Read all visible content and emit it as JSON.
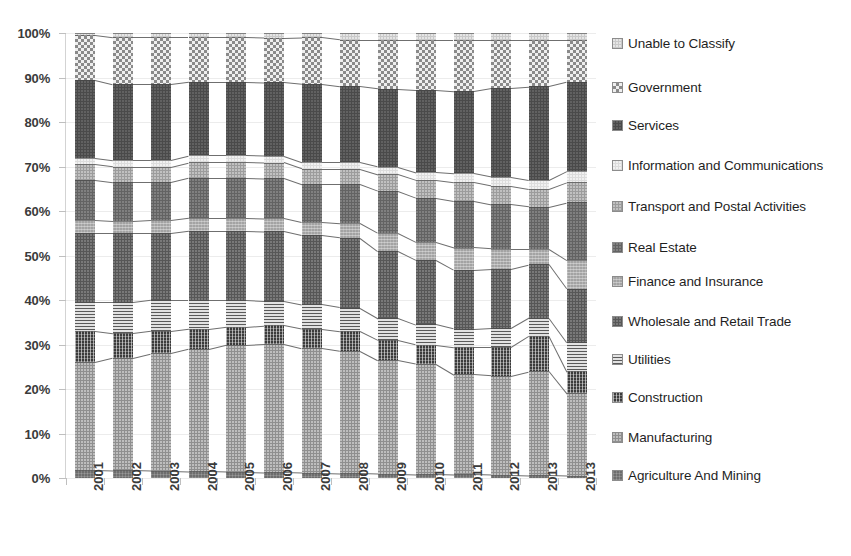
{
  "chart_data": {
    "type": "bar",
    "stacked": true,
    "normalized": "100%",
    "title": "",
    "subtitle": "",
    "xlabel": "",
    "ylabel": "",
    "ylim": [
      0,
      100
    ],
    "grid": true,
    "legend_position": "right",
    "y_tick_labels": [
      "0%",
      "10%",
      "20%",
      "30%",
      "40%",
      "50%",
      "60%",
      "70%",
      "80%",
      "90%",
      "100%"
    ],
    "y_tick_values": [
      0,
      10,
      20,
      30,
      40,
      50,
      60,
      70,
      80,
      90,
      100
    ],
    "categories": [
      "2001",
      "2002",
      "2003",
      "2004",
      "2005",
      "2006",
      "2007",
      "2008",
      "2009",
      "2010",
      "2011",
      "2012",
      "2013",
      "2013"
    ],
    "series": [
      {
        "name": "Agriculture And Mining",
        "pattern": "p-agri",
        "color": "#6d6d6d",
        "values": [
          1.8,
          1.7,
          1.6,
          1.5,
          1.4,
          1.3,
          1.2,
          1.1,
          1.0,
          0.9,
          0.8,
          0.7,
          0.6,
          0.5
        ]
      },
      {
        "name": "Manufacturing",
        "pattern": "p-manu",
        "color": "#8f8f8f",
        "values": [
          24.2,
          25.3,
          26.4,
          27.5,
          28.6,
          28.9,
          28.0,
          27.5,
          25.5,
          24.8,
          22.5,
          22.3,
          23.4,
          18.5
        ]
      },
      {
        "name": "Construction",
        "pattern": "p-cons",
        "color": "#3b3b3b",
        "values": [
          7.0,
          5.5,
          5.0,
          4.5,
          4.0,
          4.1,
          4.3,
          4.4,
          4.5,
          4.3,
          6.2,
          6.5,
          8.0,
          5.0
        ]
      },
      {
        "name": "Utilities",
        "pattern": "p-util",
        "color": "#e2e2e2",
        "values": [
          6.5,
          7.0,
          7.0,
          6.5,
          6.0,
          5.5,
          5.5,
          5.3,
          5.0,
          4.5,
          4.0,
          4.2,
          4.0,
          6.5
        ]
      },
      {
        "name": "Wholesale and Retail Trade",
        "pattern": "p-whol",
        "color": "#575757",
        "values": [
          15.5,
          15.5,
          15.0,
          15.5,
          15.5,
          15.6,
          15.5,
          15.7,
          15.0,
          14.5,
          13.3,
          13.3,
          12.0,
          12.0
        ]
      },
      {
        "name": "Finance and Insurance",
        "pattern": "p-fina",
        "color": "#a3a3a3",
        "values": [
          3.0,
          2.8,
          3.0,
          3.0,
          3.0,
          3.0,
          3.0,
          3.2,
          4.0,
          4.0,
          5.0,
          4.5,
          3.5,
          6.5
        ]
      },
      {
        "name": "Real Estate",
        "pattern": "p-real",
        "color": "#636363",
        "values": [
          9.0,
          8.7,
          8.5,
          9.0,
          9.0,
          9.0,
          8.5,
          8.8,
          9.5,
          10.0,
          10.5,
          10.0,
          9.5,
          13.0
        ]
      },
      {
        "name": "Transport and Postal Activities",
        "pattern": "p-tran",
        "color": "#9c9c9c",
        "values": [
          3.5,
          3.5,
          3.5,
          3.5,
          3.5,
          3.5,
          3.5,
          3.5,
          3.8,
          4.0,
          4.2,
          4.2,
          4.0,
          4.5
        ]
      },
      {
        "name": "Information and Communications",
        "pattern": "p-info",
        "color": "#dcdcdc",
        "values": [
          1.5,
          1.5,
          1.5,
          1.5,
          1.5,
          1.5,
          1.5,
          1.5,
          1.7,
          1.8,
          2.0,
          2.0,
          2.0,
          2.5
        ]
      },
      {
        "name": "Services",
        "pattern": "p-serv",
        "color": "#4a4a4a",
        "values": [
          17.5,
          17.0,
          17.0,
          16.5,
          16.5,
          16.5,
          17.5,
          17.0,
          17.5,
          18.5,
          18.5,
          20.0,
          21.0,
          20.0
        ]
      },
      {
        "name": "Government",
        "pattern": "p-govt",
        "color": "#efefef",
        "values": [
          10.0,
          10.5,
          10.5,
          10.0,
          10.0,
          10.0,
          10.5,
          10.5,
          11.0,
          11.2,
          11.5,
          10.8,
          10.5,
          9.5
        ]
      },
      {
        "name": "Unable to Classify",
        "pattern": "p-unab",
        "color": "#c9c9c9",
        "values": [
          0.5,
          1.0,
          1.0,
          1.0,
          1.0,
          1.1,
          1.0,
          1.5,
          1.5,
          1.5,
          1.5,
          1.5,
          1.5,
          1.5
        ]
      }
    ]
  },
  "legend": {
    "items": [
      {
        "label": "Unable to Classify",
        "pattern": "p-unab"
      },
      {
        "label": "Government",
        "pattern": "p-govt"
      },
      {
        "label": "Services",
        "pattern": "p-serv"
      },
      {
        "label": "Information and Communications",
        "pattern": "p-info"
      },
      {
        "label": "Transport and Postal Activities",
        "pattern": "p-tran"
      },
      {
        "label": "Real Estate",
        "pattern": "p-real"
      },
      {
        "label": "Finance and Insurance",
        "pattern": "p-fina"
      },
      {
        "label": "Wholesale and Retail Trade",
        "pattern": "p-whol"
      },
      {
        "label": "Utilities",
        "pattern": "p-util"
      },
      {
        "label": "Construction",
        "pattern": "p-cons"
      },
      {
        "label": "Manufacturing",
        "pattern": "p-manu"
      },
      {
        "label": "Agriculture And Mining",
        "pattern": "p-agri"
      }
    ]
  }
}
